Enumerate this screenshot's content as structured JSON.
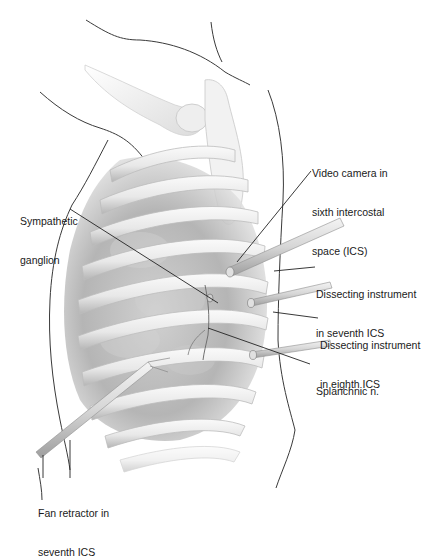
{
  "figure": {
    "colors": {
      "background": "#ffffff",
      "outline": "#3a3a3a",
      "rib_fill": "#efefef",
      "rib_shadow": "#b8b8b8",
      "cavity_shadow": "#9a9a9a",
      "instrument": "#d8d8d8",
      "leader_line": "#222222",
      "label_text": "#1a1a1a"
    }
  },
  "labels": {
    "video_camera": {
      "line1": "Video camera in",
      "line2": "sixth intercostal",
      "line3": "space (ICS)"
    },
    "sympathetic_ganglion": {
      "line1": "Sympathetic",
      "line2": "ganglion"
    },
    "dissecting_seventh": {
      "line1": "Dissecting instrument",
      "line2": "in seventh ICS"
    },
    "dissecting_eighth": {
      "line1": "Dissecting instrument",
      "line2": "in eighth ICS"
    },
    "splanchnic": {
      "line1": "Splanchnic n."
    },
    "fan_retractor": {
      "line1": "Fan retractor in",
      "line2": "seventh ICS"
    }
  }
}
